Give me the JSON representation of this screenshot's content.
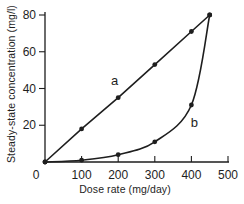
{
  "figure": {
    "background": "#ffffff",
    "ink": "#1e1e1e"
  },
  "chart_data": {
    "type": "line",
    "title": "",
    "xlabel": "Dose rate (mg/day)",
    "ylabel": "Steady-state concentration (mg/l)",
    "xlim": [
      0,
      500
    ],
    "ylim": [
      0,
      80
    ],
    "x_ticks": [
      0,
      100,
      200,
      300,
      400,
      500
    ],
    "y_ticks": [
      20,
      40,
      60,
      80
    ],
    "grid": false,
    "legend_position": "inline-annotations",
    "series": [
      {
        "name": "a",
        "annotation": "a",
        "shape": "straight",
        "marker": "filled-circle",
        "x": [
          0,
          100,
          200,
          300,
          400,
          450
        ],
        "y": [
          0,
          18,
          35,
          53,
          71,
          80
        ],
        "annotation_at": {
          "x": 190,
          "y": 44
        }
      },
      {
        "name": "b",
        "annotation": "b",
        "shape": "smooth",
        "marker": "filled-circle",
        "x": [
          0,
          100,
          200,
          300,
          400,
          450
        ],
        "y": [
          0,
          1,
          4,
          11,
          31,
          80
        ],
        "annotation_at": {
          "x": 408,
          "y": 21
        }
      }
    ]
  }
}
